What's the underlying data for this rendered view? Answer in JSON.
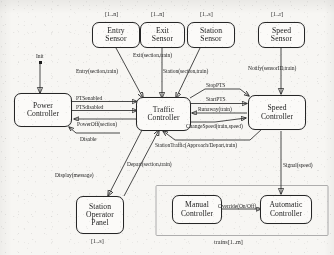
{
  "diagram": {
    "nodes": {
      "entry_sensor": {
        "line1": "Entry",
        "line2": "Sensor",
        "line3": "",
        "mult": "[1..n]"
      },
      "exit_sensor": {
        "line1": "Exit",
        "line2": "Sensor",
        "line3": "",
        "mult": "[1..n]"
      },
      "station_sensor": {
        "line1": "Station",
        "line2": "Sensor",
        "line3": "",
        "mult": "[1..s]"
      },
      "speed_sensor": {
        "line1": "Speed",
        "line2": "Sensor",
        "line3": "",
        "mult": "[1..r]"
      },
      "power_controller": {
        "line1": "Power",
        "line2": "Controller",
        "line3": "",
        "mult": ""
      },
      "traffic_controller": {
        "line1": "Traffic",
        "line2": "Controller",
        "line3": "",
        "mult": ""
      },
      "speed_controller": {
        "line1": "Speed",
        "line2": "Controller",
        "line3": "",
        "mult": ""
      },
      "operator_panel": {
        "line1": "Station",
        "line2": "Operator",
        "line3": "Panel",
        "mult": "[1..s]"
      },
      "manual_controller": {
        "line1": "Manual",
        "line2": "Controller",
        "line3": "",
        "mult": ""
      },
      "automatic_controller": {
        "line1": "Automatic",
        "line2": "Controller",
        "line3": "",
        "mult": ""
      }
    },
    "group_label": "trains[1..m]",
    "edge_labels": {
      "init": "Init",
      "entry": "Entry(section,train)",
      "exit": "Exit(section,train)",
      "station": "Station(section,train)",
      "notify": "Notify(sensorID,train)",
      "pts_enabled": "PTSenabled",
      "pts_disabled": "PTSdisabled",
      "power_off": "PowerOff(section)",
      "disable": "Disable",
      "stop_pts": "StopPTS",
      "start_pts": "StartPTS",
      "runaway": "Runaway(train)",
      "change_speed": "ChangeSpeed(train,speed)",
      "station_traffic": "StationTraffic(Approach/Depart,train)",
      "depart": "Depart(section,train)",
      "display": "Display(message)",
      "signal": "Signal(speed)",
      "override": "Override(On/Off)"
    }
  }
}
